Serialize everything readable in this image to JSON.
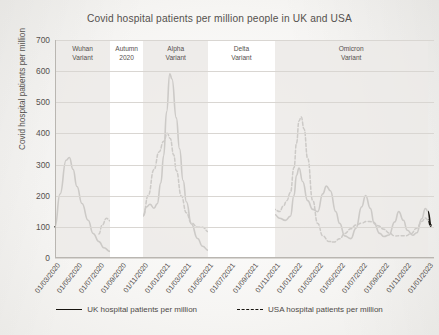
{
  "chart_data": {
    "type": "line",
    "title": "Covid hospital patients per million people in UK and USA",
    "xlabel": "",
    "ylabel": "Covid hospital patients per million",
    "ylim": [
      0,
      700
    ],
    "yticks": [
      0,
      100,
      200,
      300,
      400,
      500,
      600,
      700
    ],
    "grid": true,
    "legend_position": "bottom",
    "xticks": [
      "01/03/2020",
      "01/05/2020",
      "01/07/2020",
      "01/09/2020",
      "01/11/2020",
      "01/01/2021",
      "01/03/2021",
      "01/05/2021",
      "01/07/2021",
      "01/09/2021",
      "01/11/2021",
      "01/01/2022",
      "01/03/2022",
      "01/05/2022",
      "01/07/2022",
      "01/09/2022",
      "01/11/2022",
      "01/01/2023"
    ],
    "annotations": [
      {
        "label": "Wuhan\nVariant",
        "start": "01/03/2020",
        "end": "01/08/2020"
      },
      {
        "label": "Autumn\n2020",
        "start": "01/08/2020",
        "end": "01/11/2020"
      },
      {
        "label": "Alpha\nVariant",
        "start": "01/11/2020",
        "end": "01/05/2021"
      },
      {
        "label": "Delta\nVariant",
        "start": "01/05/2021",
        "end": "01/11/2021"
      },
      {
        "label": "Omicron\nVariant",
        "start": "01/11/2021",
        "end": "01/01/2023"
      }
    ],
    "series": [
      {
        "name": "UK hospital patients per million",
        "style": "solid",
        "color": "#17140f",
        "points": [
          {
            "x": "01/03/2020",
            "y": 100
          },
          {
            "x": "15/03/2020",
            "y": 205
          },
          {
            "x": "01/04/2020",
            "y": 315
          },
          {
            "x": "10/04/2020",
            "y": 322
          },
          {
            "x": "20/04/2020",
            "y": 285
          },
          {
            "x": "01/05/2020",
            "y": 230
          },
          {
            "x": "15/05/2020",
            "y": 175
          },
          {
            "x": "01/06/2020",
            "y": 120
          },
          {
            "x": "15/06/2020",
            "y": 80
          },
          {
            "x": "01/07/2020",
            "y": 52
          },
          {
            "x": "15/07/2020",
            "y": 33
          },
          {
            "x": "01/08/2020",
            "y": 22
          },
          {
            "x": "15/08/2020",
            "y": 17
          },
          {
            "x": "01/09/2020",
            "y": 16
          },
          {
            "x": "15/09/2020",
            "y": 22
          },
          {
            "x": "01/10/2020",
            "y": 42
          },
          {
            "x": "15/10/2020",
            "y": 80
          },
          {
            "x": "01/11/2020",
            "y": 135
          },
          {
            "x": "10/11/2020",
            "y": 165
          },
          {
            "x": "20/11/2020",
            "y": 172
          },
          {
            "x": "01/12/2020",
            "y": 160
          },
          {
            "x": "10/12/2020",
            "y": 175
          },
          {
            "x": "20/12/2020",
            "y": 240
          },
          {
            "x": "28/12/2020",
            "y": 330
          },
          {
            "x": "05/01/2021",
            "y": 470
          },
          {
            "x": "14/01/2021",
            "y": 590
          },
          {
            "x": "20/01/2021",
            "y": 575
          },
          {
            "x": "01/02/2021",
            "y": 450
          },
          {
            "x": "10/02/2021",
            "y": 350
          },
          {
            "x": "20/02/2021",
            "y": 250
          },
          {
            "x": "01/03/2021",
            "y": 180
          },
          {
            "x": "15/03/2021",
            "y": 110
          },
          {
            "x": "01/04/2021",
            "y": 62
          },
          {
            "x": "15/04/2021",
            "y": 38
          },
          {
            "x": "01/05/2021",
            "y": 25
          },
          {
            "x": "15/05/2021",
            "y": 18
          },
          {
            "x": "01/06/2021",
            "y": 17
          },
          {
            "x": "15/06/2021",
            "y": 25
          },
          {
            "x": "01/07/2021",
            "y": 50
          },
          {
            "x": "15/07/2021",
            "y": 85
          },
          {
            "x": "25/07/2021",
            "y": 105
          },
          {
            "x": "05/08/2021",
            "y": 98
          },
          {
            "x": "15/08/2021",
            "y": 105
          },
          {
            "x": "01/09/2021",
            "y": 118
          },
          {
            "x": "15/09/2021",
            "y": 125
          },
          {
            "x": "25/09/2021",
            "y": 112
          },
          {
            "x": "05/10/2021",
            "y": 118
          },
          {
            "x": "20/10/2021",
            "y": 135
          },
          {
            "x": "01/11/2021",
            "y": 140
          },
          {
            "x": "15/11/2021",
            "y": 128
          },
          {
            "x": "01/12/2021",
            "y": 120
          },
          {
            "x": "15/12/2021",
            "y": 135
          },
          {
            "x": "25/12/2021",
            "y": 200
          },
          {
            "x": "01/01/2022",
            "y": 265
          },
          {
            "x": "08/01/2022",
            "y": 290
          },
          {
            "x": "18/01/2022",
            "y": 245
          },
          {
            "x": "01/02/2022",
            "y": 185
          },
          {
            "x": "15/02/2022",
            "y": 155
          },
          {
            "x": "01/03/2022",
            "y": 150
          },
          {
            "x": "15/03/2022",
            "y": 205
          },
          {
            "x": "25/03/2022",
            "y": 232
          },
          {
            "x": "05/04/2022",
            "y": 215
          },
          {
            "x": "20/04/2022",
            "y": 150
          },
          {
            "x": "01/05/2022",
            "y": 110
          },
          {
            "x": "15/05/2022",
            "y": 72
          },
          {
            "x": "01/06/2022",
            "y": 62
          },
          {
            "x": "15/06/2022",
            "y": 95
          },
          {
            "x": "01/07/2022",
            "y": 165
          },
          {
            "x": "12/07/2022",
            "y": 200
          },
          {
            "x": "25/07/2022",
            "y": 160
          },
          {
            "x": "05/08/2022",
            "y": 110
          },
          {
            "x": "20/08/2022",
            "y": 80
          },
          {
            "x": "01/09/2022",
            "y": 68
          },
          {
            "x": "15/09/2022",
            "y": 75
          },
          {
            "x": "01/10/2022",
            "y": 115
          },
          {
            "x": "12/10/2022",
            "y": 150
          },
          {
            "x": "25/10/2022",
            "y": 120
          },
          {
            "x": "05/11/2022",
            "y": 90
          },
          {
            "x": "20/11/2022",
            "y": 72
          },
          {
            "x": "01/12/2022",
            "y": 82
          },
          {
            "x": "15/12/2022",
            "y": 125
          },
          {
            "x": "25/12/2022",
            "y": 160
          },
          {
            "x": "01/01/2023",
            "y": 150
          },
          {
            "x": "10/01/2023",
            "y": 105
          }
        ]
      },
      {
        "name": "USA hospital patients per million",
        "style": "dashed",
        "color": "#17140f",
        "points": [
          {
            "x": "01/07/2020",
            "y": 78
          },
          {
            "x": "10/07/2020",
            "y": 105
          },
          {
            "x": "22/07/2020",
            "y": 128
          },
          {
            "x": "01/08/2020",
            "y": 120
          },
          {
            "x": "15/08/2020",
            "y": 95
          },
          {
            "x": "01/09/2020",
            "y": 72
          },
          {
            "x": "15/09/2020",
            "y": 62
          },
          {
            "x": "01/10/2020",
            "y": 65
          },
          {
            "x": "15/10/2020",
            "y": 88
          },
          {
            "x": "01/11/2020",
            "y": 135
          },
          {
            "x": "15/11/2020",
            "y": 200
          },
          {
            "x": "01/12/2020",
            "y": 285
          },
          {
            "x": "15/12/2020",
            "y": 340
          },
          {
            "x": "28/12/2020",
            "y": 375
          },
          {
            "x": "07/01/2021",
            "y": 400
          },
          {
            "x": "15/01/2021",
            "y": 385
          },
          {
            "x": "25/01/2021",
            "y": 330
          },
          {
            "x": "01/02/2021",
            "y": 280
          },
          {
            "x": "15/02/2021",
            "y": 200
          },
          {
            "x": "01/03/2021",
            "y": 145
          },
          {
            "x": "15/03/2021",
            "y": 112
          },
          {
            "x": "01/04/2021",
            "y": 100
          },
          {
            "x": "15/04/2021",
            "y": 98
          },
          {
            "x": "01/05/2021",
            "y": 85
          },
          {
            "x": "15/05/2021",
            "y": 62
          },
          {
            "x": "01/06/2021",
            "y": 45
          },
          {
            "x": "15/06/2021",
            "y": 38
          },
          {
            "x": "01/07/2021",
            "y": 40
          },
          {
            "x": "15/07/2021",
            "y": 62
          },
          {
            "x": "01/08/2021",
            "y": 130
          },
          {
            "x": "15/08/2021",
            "y": 215
          },
          {
            "x": "01/09/2021",
            "y": 280
          },
          {
            "x": "10/09/2021",
            "y": 300
          },
          {
            "x": "20/09/2021",
            "y": 285
          },
          {
            "x": "01/10/2021",
            "y": 240
          },
          {
            "x": "15/10/2021",
            "y": 190
          },
          {
            "x": "01/11/2021",
            "y": 155
          },
          {
            "x": "15/11/2021",
            "y": 150
          },
          {
            "x": "25/11/2021",
            "y": 165
          },
          {
            "x": "05/12/2021",
            "y": 185
          },
          {
            "x": "15/12/2021",
            "y": 210
          },
          {
            "x": "25/12/2021",
            "y": 290
          },
          {
            "x": "01/01/2022",
            "y": 370
          },
          {
            "x": "08/01/2022",
            "y": 440
          },
          {
            "x": "14/01/2022",
            "y": 452
          },
          {
            "x": "22/01/2022",
            "y": 415
          },
          {
            "x": "01/02/2022",
            "y": 320
          },
          {
            "x": "15/02/2022",
            "y": 185
          },
          {
            "x": "01/03/2022",
            "y": 110
          },
          {
            "x": "15/03/2022",
            "y": 72
          },
          {
            "x": "01/04/2022",
            "y": 52
          },
          {
            "x": "15/04/2022",
            "y": 52
          },
          {
            "x": "01/05/2022",
            "y": 62
          },
          {
            "x": "15/05/2022",
            "y": 78
          },
          {
            "x": "01/06/2022",
            "y": 95
          },
          {
            "x": "15/06/2022",
            "y": 105
          },
          {
            "x": "01/07/2022",
            "y": 112
          },
          {
            "x": "15/07/2022",
            "y": 118
          },
          {
            "x": "01/08/2022",
            "y": 115
          },
          {
            "x": "15/08/2022",
            "y": 105
          },
          {
            "x": "01/09/2022",
            "y": 92
          },
          {
            "x": "15/09/2022",
            "y": 80
          },
          {
            "x": "01/10/2022",
            "y": 72
          },
          {
            "x": "15/10/2022",
            "y": 70
          },
          {
            "x": "01/11/2022",
            "y": 72
          },
          {
            "x": "15/11/2022",
            "y": 78
          },
          {
            "x": "01/12/2022",
            "y": 95
          },
          {
            "x": "15/12/2022",
            "y": 118
          },
          {
            "x": "25/12/2022",
            "y": 128
          },
          {
            "x": "01/01/2023",
            "y": 122
          },
          {
            "x": "10/01/2023",
            "y": 100
          }
        ]
      }
    ]
  }
}
